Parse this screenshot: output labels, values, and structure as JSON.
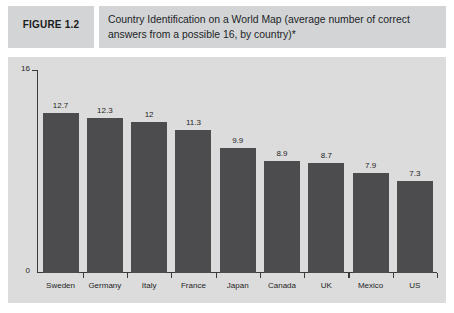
{
  "figure": {
    "label": "FIGURE 1.2",
    "title": "Country Identification on a World Map (average number of correct answers from a possible 16, by country)*"
  },
  "colors": {
    "panel_background": "#dcdcdc",
    "header_background": "#d2d4d6",
    "bar": "#4c4c4e",
    "axis": "#3a3a3a",
    "text": "#1f1f1f"
  },
  "chart_data": {
    "type": "bar",
    "title": "Country Identification on a World Map (average number of correct answers from a possible 16, by country)*",
    "categories": [
      "Sweden",
      "Germany",
      "Italy",
      "France",
      "Japan",
      "Canada",
      "UK",
      "Mexico",
      "US"
    ],
    "values": [
      12.7,
      12.3,
      12,
      11.3,
      9.9,
      8.9,
      8.7,
      7.9,
      7.3
    ],
    "value_labels": [
      "12.7",
      "12.3",
      "12",
      "11.3",
      "9.9",
      "8.9",
      "8.7",
      "7.9",
      "7.3"
    ],
    "xlabel": "",
    "ylabel": "",
    "ylim": [
      0,
      16
    ],
    "ytick_labels": [
      "0",
      "16"
    ],
    "grid": false,
    "legend": false
  }
}
